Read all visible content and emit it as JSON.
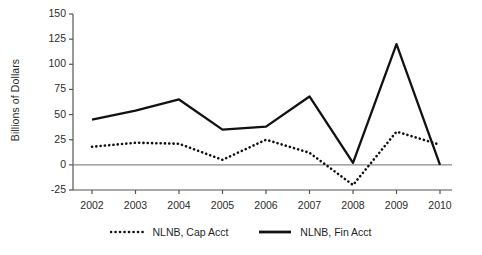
{
  "chart_data": {
    "type": "line",
    "title": "",
    "xlabel": "",
    "ylabel": "Billions of Dollars",
    "categories": [
      "2002",
      "2003",
      "2004",
      "2005",
      "2006",
      "2007",
      "2008",
      "2009",
      "2010"
    ],
    "x": [
      2002,
      2003,
      2004,
      2005,
      2006,
      2007,
      2008,
      2009,
      2010
    ],
    "ylim": [
      -25,
      150
    ],
    "yticks": [
      -25,
      0,
      25,
      50,
      75,
      100,
      125,
      150
    ],
    "ytick_labels": [
      "-25",
      "0",
      "25",
      "50",
      "75",
      "100",
      "125",
      "150"
    ],
    "grid": false,
    "zero_line": true,
    "legend_position": "bottom-center",
    "series": [
      {
        "name": "NLNB, Cap Acct",
        "style": "dotted",
        "color": "#111111",
        "values": [
          18,
          22,
          21,
          5,
          25,
          12,
          -20,
          33,
          20
        ]
      },
      {
        "name": "NLNB, Fin Acct",
        "style": "solid",
        "color": "#111111",
        "values": [
          45,
          54,
          65,
          35,
          38,
          68,
          2,
          120,
          0
        ]
      }
    ]
  },
  "axis": {
    "ylabel": "Billions of Dollars"
  },
  "legend": {
    "entries": [
      {
        "label": "NLNB, Cap Acct",
        "style": "dotted"
      },
      {
        "label": "NLNB, Fin Acct",
        "style": "solid"
      }
    ]
  },
  "colors": {
    "line": "#111111",
    "axis": "#555555",
    "zero_line": "#8a8a8a",
    "text": "#2b2b2b",
    "background": "#ffffff"
  }
}
